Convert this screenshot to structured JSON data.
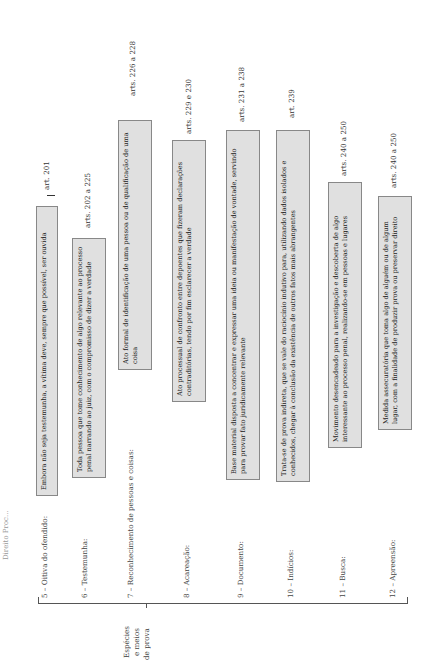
{
  "header": {
    "text": "Direito Proc..."
  },
  "group_label": [
    "Espécies",
    "e meios",
    "de prova"
  ],
  "items": [
    {
      "label": "5 – Oitiva do ofendido:",
      "text": "Embora não seja testemunha, a vítima deve, sempre que possível, ser ouvida",
      "ref": "art. 201"
    },
    {
      "label": "6 – Testemunha:",
      "text": "Toda pessoa que tome conhecimento de algo relevante ao processo penal narrando ao juiz, com o compromisso de dizer a verdade",
      "ref": "arts. 202 a 225"
    },
    {
      "label": "7 – Reconhecimento de pessoas e coisas:",
      "text": "Ato formal de identificação de uma pessoa ou de qualificação de uma coisa",
      "ref": "arts. 226 a 228"
    },
    {
      "label": "8 – Acareação:",
      "text": "Ato processual de confronto entre depoentes que fizeram declarações contraditórias, tendo por fim esclarecer a verdade",
      "ref": "arts. 229 e 230"
    },
    {
      "label": "9 – Documento:",
      "text": "Base material disposta a concentrar e expressar uma ideia ou manifestação de vontade, servindo para provar fato juridicamente relevante",
      "ref": "arts. 231 a 238"
    },
    {
      "label": "10 – Indícios:",
      "text": "Trata-se de prova indireta, que se vale do raciocínio indutivo para, utilizando dados isolados e conhecidos, chegar à conclusão da existência de outros fatos mais abrangentes",
      "ref": "art. 239"
    },
    {
      "label": "11 – Busca:",
      "text": "Movimento desencadeado para a investigação e descoberta de algo interessante ao processo penal, realizando-se em pessoas e lugares",
      "ref": "arts. 240 a 250"
    },
    {
      "label": "12 – Apreensão:",
      "text": "Medida assecuratória que toma algo de alguém ou de algum lugar, com a finalidade de produzir prova ou preservar direito",
      "ref": "arts. 240 a 250"
    }
  ]
}
